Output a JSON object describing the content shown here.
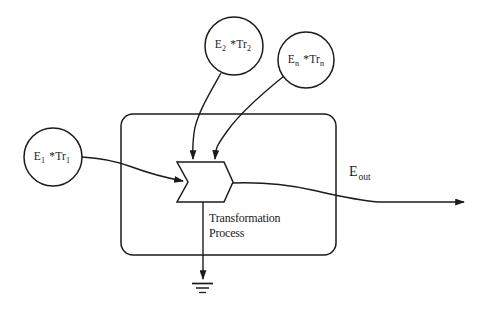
{
  "canvas": {
    "background": "#ffffff",
    "ink": "#1b1b1b"
  },
  "sources": [
    {
      "base": "E",
      "base_sub": "2",
      "factor": "*Tr",
      "factor_sub": "2"
    },
    {
      "base": "E",
      "base_sub": "n",
      "factor": "*Tr",
      "factor_sub": "n"
    },
    {
      "base": "E",
      "base_sub": "1",
      "factor": "*Tr",
      "factor_sub": "1"
    }
  ],
  "output": {
    "base": "E",
    "sub": "out"
  },
  "process": {
    "line1": "Transformation",
    "line2": "Process"
  }
}
